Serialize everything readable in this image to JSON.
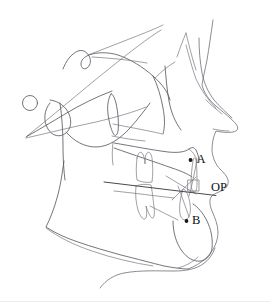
{
  "figure": {
    "width": 270,
    "height": 302,
    "background_color": "#ffffff",
    "trace_color": "#5b5b63",
    "plane_color": "#3f3f46",
    "label_color": "#0f0f12"
  },
  "landmarks": [
    {
      "id": "point-a",
      "label": "A",
      "description": "A point (subspinale) - deepest point on anterior maxilla",
      "dot": {
        "x": 190.5,
        "y": 160.0,
        "r": 1.9
      },
      "text": {
        "x": 196.5,
        "y": 160.5
      }
    },
    {
      "id": "point-b",
      "label": "B",
      "description": "B point (supramentale) - deepest point on anterior mandible",
      "dot": {
        "x": 186.5,
        "y": 221.0,
        "r": 1.9
      },
      "text": {
        "x": 192.0,
        "y": 221.5
      }
    }
  ],
  "planes": [
    {
      "id": "occlusal-plane",
      "label": "OP",
      "description": "Occlusal plane line through molar and incisor contact",
      "x1": 104.0,
      "y1": 182.0,
      "x2": 216.0,
      "y2": 195.5,
      "text": {
        "x": 211.0,
        "y": 188.0
      }
    }
  ],
  "structures": [
    {
      "id": "sella-circle",
      "name": "sella-turcica"
    },
    {
      "id": "cranial-base",
      "name": "anterior-cranial-base"
    },
    {
      "id": "soft-tissue-profile",
      "name": "facial-soft-tissue-outline"
    },
    {
      "id": "maxilla",
      "name": "maxilla-and-palate"
    },
    {
      "id": "mandible",
      "name": "mandible-outline"
    },
    {
      "id": "upper-molar",
      "name": "upper-first-molar"
    },
    {
      "id": "lower-molar",
      "name": "lower-first-molar"
    },
    {
      "id": "upper-incisor",
      "name": "upper-central-incisor"
    },
    {
      "id": "lower-incisor",
      "name": "lower-central-incisor"
    },
    {
      "id": "orbit",
      "name": "orbital-rim"
    },
    {
      "id": "pterygomaxillary-fissure",
      "name": "pterygomaxillary-fissure"
    },
    {
      "id": "neck-outline",
      "name": "neck-and-submental-outline"
    }
  ]
}
